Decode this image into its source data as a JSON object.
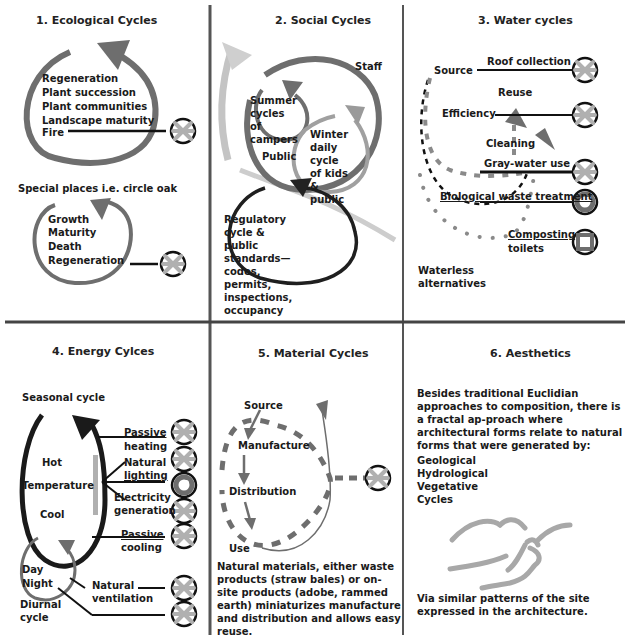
{
  "panels": [
    {
      "title": "1. Ecological Cycles",
      "cycle1_items": [
        "Regeneration",
        "Plant succession",
        "Plant communities",
        "Landscape maturity",
        "Fire"
      ],
      "special_label": "Special places i.e. circle oak",
      "cycle2_items": [
        "Growth",
        "Maturity",
        "Death",
        "Regeneration"
      ]
    },
    {
      "title": "2. Social Cycles",
      "staff": "Staff",
      "summer": "Summer\ncycles of\ncampers",
      "winter": "Winter daily\ncycle of kids\n& public",
      "public": "Public",
      "regulatory": "Regulatory cycle & public\nstandards—codes, permits,\ninspections, occupancy"
    },
    {
      "title": "3. Water cycles",
      "source": "Source",
      "roof": "Roof collection",
      "reuse": "Reuse",
      "efficiency": "Efficiency",
      "cleaning": "Cleaning",
      "graywater": "Gray-water use",
      "biological": "Biological waste treatment",
      "composting": "Composting",
      "toilets": "toilets",
      "waterless": "Waterless\nalternatives"
    },
    {
      "title": "4. Energy Cylces",
      "seasonal": "Seasonal cycle",
      "hot": "Hot",
      "temperature": "Temperature",
      "cool": "Cool",
      "day": "Day",
      "night": "Night",
      "diurnal": "Diurnal\ncycle",
      "passive_heating": [
        "Passive",
        "heating"
      ],
      "natural_lighting": [
        "Natural",
        "lighting"
      ],
      "electricity": [
        "Electricity",
        "generation"
      ],
      "passive_cooling": [
        "Passive",
        "cooling"
      ],
      "natural_ventilation": "Natural\nventilation"
    },
    {
      "title": "5. Material Cycles",
      "source": "Source",
      "manufacture": "Manufacture",
      "distribution": "Distribution",
      "use": "Use",
      "paragraph": "Natural materials, either waste products (straw bales) or on-site products (adobe, rammed earth) miniaturizes manufacture and distribution and allows easy reuse."
    },
    {
      "title": "6. Aesthetics",
      "paragraph": "Besides traditional Euclidian approaches to composition, there is a fractal ap-proach where architectural forms relate to natural forms that were generated by:",
      "list": "Geological\nHydrological\nVegetative\nCycles",
      "footer": "Via similar patterns of the site expressed in the architecture."
    }
  ],
  "colors": {
    "dark": "#1a1a1a",
    "mid_gray": "#6e6e6e",
    "light_gray": "#b0b0b0",
    "symbol_gray": "#a8a8a8"
  }
}
